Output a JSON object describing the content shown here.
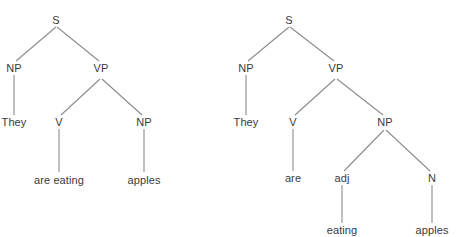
{
  "diagram": {
    "type": "constituency-parse-trees",
    "background_color": "#ffffff",
    "line_color": "#8c8c8c",
    "text_color": "#3a3a3a",
    "sentence": "They are eating apples",
    "trees": [
      {
        "id": "tree-left",
        "reading": "They are eating apples (progressive verb phrase)",
        "nodes": [
          {
            "id": "L-S",
            "label": "S",
            "x": 56,
            "y": 20,
            "kind": "nonterminal"
          },
          {
            "id": "L-NP",
            "label": "NP",
            "x": 14,
            "y": 68,
            "kind": "nonterminal"
          },
          {
            "id": "L-VP",
            "label": "VP",
            "x": 101,
            "y": 68,
            "kind": "nonterminal"
          },
          {
            "id": "L-They",
            "label": "They",
            "x": 14,
            "y": 122,
            "kind": "terminal"
          },
          {
            "id": "L-V",
            "label": "V",
            "x": 59,
            "y": 122,
            "kind": "nonterminal"
          },
          {
            "id": "L-NP2",
            "label": "NP",
            "x": 144,
            "y": 122,
            "kind": "nonterminal"
          },
          {
            "id": "L-areeating",
            "label": "are eating",
            "x": 59,
            "y": 180,
            "kind": "terminal"
          },
          {
            "id": "L-apples",
            "label": "apples",
            "x": 144,
            "y": 180,
            "kind": "terminal"
          }
        ],
        "edges": [
          {
            "from": "L-S",
            "to": "L-NP",
            "x1": 56,
            "y1": 27,
            "x2": 16,
            "y2": 61
          },
          {
            "from": "L-S",
            "to": "L-VP",
            "x1": 57,
            "y1": 27,
            "x2": 99,
            "y2": 61
          },
          {
            "from": "L-NP",
            "to": "L-They",
            "x1": 14,
            "y1": 75,
            "x2": 14,
            "y2": 115
          },
          {
            "from": "L-VP",
            "to": "L-V",
            "x1": 100,
            "y1": 79,
            "x2": 61,
            "y2": 115
          },
          {
            "from": "L-VP",
            "to": "L-NP2",
            "x1": 102,
            "y1": 79,
            "x2": 142,
            "y2": 115
          },
          {
            "from": "L-V",
            "to": "L-areeating",
            "x1": 59,
            "y1": 129,
            "x2": 59,
            "y2": 172
          },
          {
            "from": "L-NP2",
            "to": "L-apples",
            "x1": 144,
            "y1": 129,
            "x2": 144,
            "y2": 172
          }
        ]
      },
      {
        "id": "tree-right",
        "reading": "They are eating apples (copula with adjectival complement)",
        "nodes": [
          {
            "id": "R-S",
            "label": "S",
            "x": 289,
            "y": 20,
            "kind": "nonterminal"
          },
          {
            "id": "R-NP",
            "label": "NP",
            "x": 246,
            "y": 68,
            "kind": "nonterminal"
          },
          {
            "id": "R-VP",
            "label": "VP",
            "x": 336,
            "y": 68,
            "kind": "nonterminal"
          },
          {
            "id": "R-They",
            "label": "They",
            "x": 246,
            "y": 122,
            "kind": "terminal"
          },
          {
            "id": "R-V",
            "label": "V",
            "x": 293,
            "y": 122,
            "kind": "nonterminal"
          },
          {
            "id": "R-NP2",
            "label": "NP",
            "x": 385,
            "y": 122,
            "kind": "nonterminal"
          },
          {
            "id": "R-are",
            "label": "are",
            "x": 293,
            "y": 178,
            "kind": "terminal"
          },
          {
            "id": "R-adj",
            "label": "adj",
            "x": 342,
            "y": 178,
            "kind": "nonterminal"
          },
          {
            "id": "R-N",
            "label": "N",
            "x": 432,
            "y": 178,
            "kind": "nonterminal"
          },
          {
            "id": "R-eating",
            "label": "eating",
            "x": 342,
            "y": 230,
            "kind": "terminal"
          },
          {
            "id": "R-apples",
            "label": "apples",
            "x": 432,
            "y": 230,
            "kind": "terminal"
          }
        ],
        "edges": [
          {
            "from": "R-S",
            "to": "R-NP",
            "x1": 289,
            "y1": 27,
            "x2": 248,
            "y2": 61
          },
          {
            "from": "R-S",
            "to": "R-VP",
            "x1": 290,
            "y1": 27,
            "x2": 334,
            "y2": 61
          },
          {
            "from": "R-NP",
            "to": "R-They",
            "x1": 246,
            "y1": 75,
            "x2": 246,
            "y2": 115
          },
          {
            "from": "R-VP",
            "to": "R-V",
            "x1": 335,
            "y1": 79,
            "x2": 295,
            "y2": 115
          },
          {
            "from": "R-VP",
            "to": "R-NP2",
            "x1": 337,
            "y1": 79,
            "x2": 383,
            "y2": 115
          },
          {
            "from": "R-V",
            "to": "R-are",
            "x1": 293,
            "y1": 129,
            "x2": 293,
            "y2": 171
          },
          {
            "from": "R-NP2",
            "to": "R-adj",
            "x1": 384,
            "y1": 130,
            "x2": 344,
            "y2": 171
          },
          {
            "from": "R-NP2",
            "to": "R-N",
            "x1": 386,
            "y1": 130,
            "x2": 430,
            "y2": 171
          },
          {
            "from": "R-adj",
            "to": "R-eating",
            "x1": 342,
            "y1": 185,
            "x2": 342,
            "y2": 223
          },
          {
            "from": "R-N",
            "to": "R-apples",
            "x1": 432,
            "y1": 185,
            "x2": 432,
            "y2": 223
          }
        ]
      }
    ]
  }
}
